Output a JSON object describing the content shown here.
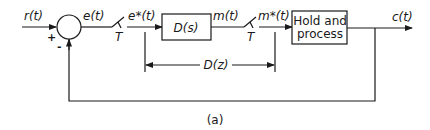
{
  "diagram": {
    "type": "block-diagram",
    "signals": {
      "input": "r(t)",
      "error": "e(t)",
      "sampled_error": "e*(t)",
      "controller_output": "m(t)",
      "sampled_controller_output": "m*(t)",
      "output": "c(t)"
    },
    "summing_junction": {
      "plus_sign": "+",
      "minus_sign": "-"
    },
    "samplers": [
      {
        "period_label": "T"
      },
      {
        "period_label": "T"
      }
    ],
    "blocks": [
      {
        "id": "controller",
        "label": "D(s)"
      },
      {
        "id": "plant",
        "label_line1": "Hold and",
        "label_line2": "process"
      }
    ],
    "dimension": {
      "label": "D(z)"
    },
    "caption": "(a)",
    "colors": {
      "line": "#1a1a1a",
      "background": "#ffffff"
    }
  }
}
